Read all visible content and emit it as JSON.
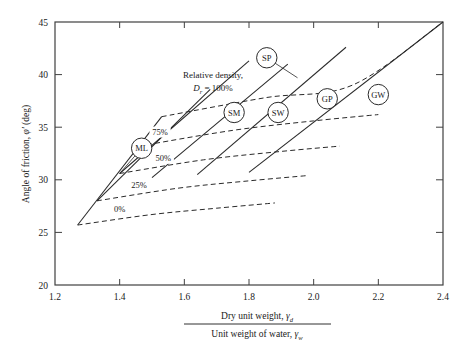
{
  "chart_data": {
    "type": "line",
    "title": "",
    "xlabel_numerator": "Dry unit weight, γd",
    "xlabel_denominator": "Unit weight of water, γw",
    "ylabel": "Angle of friction, φ′ (deg)",
    "xlim": [
      1.2,
      2.4
    ],
    "ylim": [
      20,
      45
    ],
    "xticks": [
      1.2,
      1.4,
      1.6,
      1.8,
      2.0,
      2.2,
      2.4
    ],
    "xticklabels": [
      "1.2",
      "1.4",
      "1.6",
      "1.8",
      "2.0",
      "2.2",
      "2.4"
    ],
    "yticks": [
      20,
      25,
      30,
      35,
      40,
      45
    ],
    "yticklabels": [
      "20",
      "25",
      "30",
      "35",
      "40",
      "45"
    ],
    "grid": false,
    "legend": "none",
    "annotation_title": "Relative density,",
    "annotation_sub": "Dr = 100%",
    "annotation_var": "D",
    "annotation_varsub": "r",
    "annotation_eq": " = 100%",
    "density_curves": [
      {
        "name": "0%",
        "label": "0%",
        "style": "dashed",
        "points": [
          [
            1.27,
            25.7
          ],
          [
            1.5,
            26.7
          ],
          [
            1.7,
            27.3
          ],
          [
            1.88,
            27.8
          ]
        ]
      },
      {
        "name": "25%",
        "label": "25%",
        "style": "dashed",
        "points": [
          [
            1.33,
            28.0
          ],
          [
            1.58,
            29.2
          ],
          [
            1.8,
            29.9
          ],
          [
            1.98,
            30.4
          ]
        ]
      },
      {
        "name": "50%",
        "label": "50%",
        "style": "dashed",
        "points": [
          [
            1.4,
            30.6
          ],
          [
            1.66,
            31.9
          ],
          [
            1.9,
            32.7
          ],
          [
            2.08,
            33.2
          ]
        ]
      },
      {
        "name": "75%",
        "label": "75%",
        "style": "dashed",
        "points": [
          [
            1.46,
            33.2
          ],
          [
            1.75,
            34.7
          ],
          [
            2.0,
            35.6
          ],
          [
            2.2,
            36.2
          ]
        ]
      },
      {
        "name": "100%",
        "label": "100%",
        "style": "dashed",
        "points": [
          [
            1.53,
            36.0
          ],
          [
            1.85,
            37.8
          ],
          [
            2.12,
            39.0
          ],
          [
            2.4,
            45.0
          ]
        ]
      }
    ],
    "soil_curves": [
      {
        "name": "ML",
        "style": "solid",
        "points": [
          [
            1.27,
            25.7
          ],
          [
            1.53,
            36.0
          ]
        ]
      },
      {
        "name": "SM",
        "style": "solid",
        "points": [
          [
            1.33,
            28.0
          ],
          [
            1.68,
            38.6
          ]
        ]
      },
      {
        "name": "SP",
        "style": "solid",
        "points": [
          [
            1.4,
            30.6
          ],
          [
            1.8,
            41.3
          ]
        ]
      },
      {
        "name": "SW",
        "style": "solid",
        "points": [
          [
            1.5,
            30.2
          ],
          [
            1.92,
            41.0
          ]
        ]
      },
      {
        "name": "GP",
        "style": "solid",
        "points": [
          [
            1.64,
            30.5
          ],
          [
            2.1,
            42.6
          ]
        ]
      },
      {
        "name": "GW",
        "style": "solid",
        "points": [
          [
            1.8,
            30.7
          ],
          [
            2.4,
            45.0
          ]
        ]
      }
    ],
    "soil_markers": [
      {
        "label": "ML",
        "x": 1.468,
        "y": 33.0
      },
      {
        "label": "SP",
        "x": 1.855,
        "y": 41.6
      },
      {
        "label": "SM",
        "x": 1.754,
        "y": 36.4
      },
      {
        "label": "SW",
        "x": 1.89,
        "y": 36.4
      },
      {
        "label": "GP",
        "x": 2.042,
        "y": 37.7
      },
      {
        "label": "GW",
        "x": 2.2,
        "y": 38.1
      }
    ],
    "leader_lines": [
      {
        "from": [
          1.468,
          33.0
        ],
        "to": [
          1.4,
          30.6
        ]
      },
      {
        "from": [
          1.855,
          41.6
        ],
        "to": [
          1.95,
          39.7
        ]
      }
    ],
    "colors": {
      "axis": "#404040",
      "line": "#2a2a2a",
      "text": "#1a1a1a",
      "background": "#ffffff"
    }
  }
}
